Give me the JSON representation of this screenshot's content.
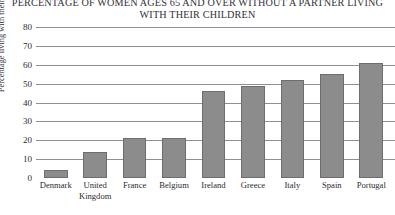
{
  "chart_data": {
    "type": "bar",
    "title": "PERCENTAGE OF WOMEN AGES 65 AND OVER WITHOUT A PARTNER LIVING WITH THEIR CHILDREN",
    "title_lines": [
      "PERCENTAGE OF WOMEN AGES 65 AND OVER WITHOUT A PARTNER LIVING",
      "WITH THEIR CHILDREN"
    ],
    "xlabel": "",
    "ylabel": "Percentage living with their children",
    "ylim": [
      0,
      80
    ],
    "ytick_step": 10,
    "yticks": [
      0,
      10,
      20,
      30,
      40,
      50,
      60,
      70,
      80
    ],
    "ytick_labels": [
      "0",
      "10",
      "20",
      "30",
      "40",
      "50",
      "60",
      "70",
      "80"
    ],
    "grid": true,
    "legend": false,
    "legend_position": "none",
    "categories": [
      "Denmark",
      "United Kingdom",
      "France",
      "Belgium",
      "Ireland",
      "Greece",
      "Italy",
      "Spain",
      "Portugal"
    ],
    "category_label_lines": [
      [
        "Denmark"
      ],
      [
        "United",
        "Kingdom"
      ],
      [
        "France"
      ],
      [
        "Belgium"
      ],
      [
        "Ireland"
      ],
      [
        "Greece"
      ],
      [
        "Italy"
      ],
      [
        "Spain"
      ],
      [
        "Portugal"
      ]
    ],
    "values": [
      4,
      14,
      21,
      21,
      46,
      49,
      52,
      55,
      61
    ],
    "bar_color": "#8c8c8c",
    "bar_edge_color": "#6d6d70",
    "grid_color": "#8e8e96",
    "text_color": "#2b2b33"
  }
}
